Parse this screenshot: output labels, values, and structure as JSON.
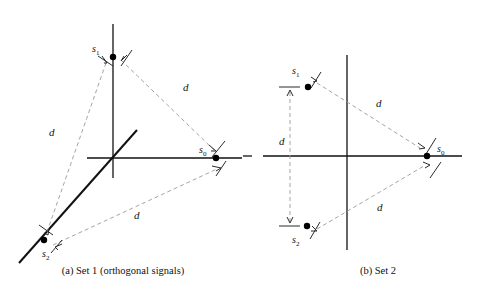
{
  "figure": {
    "panels": [
      {
        "id": "panel-a",
        "caption": "(a) Set 1 (orthogonal signals)",
        "signals": [
          {
            "name": "s",
            "index": "0",
            "x": 216,
            "y": 158
          },
          {
            "name": "s",
            "index": "1",
            "x": 113,
            "y": 57
          },
          {
            "name": "s",
            "index": "2",
            "x": 44,
            "y": 240
          }
        ],
        "distance_labels": [
          {
            "text": "d",
            "x": 53,
            "y": 136
          },
          {
            "text": "d",
            "x": 186,
            "y": 91
          },
          {
            "text": "d",
            "x": 137,
            "y": 218
          }
        ],
        "axes": {
          "origin_x": 113,
          "origin_y": 158,
          "v_top": 24,
          "v_bottom": 178,
          "h_left": 87,
          "h_right": 242,
          "diagonal_x1": 137,
          "diagonal_y1": 130,
          "diagonal_x2": 19,
          "diagonal_y2": 263
        }
      },
      {
        "id": "panel-b",
        "caption": "(b) Set 2",
        "signals": [
          {
            "name": "s",
            "index": "0",
            "x": 427,
            "y": 156
          },
          {
            "name": "s",
            "index": "1",
            "x": 308,
            "y": 87
          },
          {
            "name": "s",
            "index": "2",
            "x": 307,
            "y": 226
          }
        ],
        "distance_labels": [
          {
            "text": "d",
            "x": 283,
            "y": 144
          },
          {
            "text": "d",
            "x": 379,
            "y": 107
          },
          {
            "text": "d",
            "x": 380,
            "y": 211
          }
        ],
        "axes": {
          "origin_x": 347,
          "origin_y": 156,
          "v_top": 55,
          "v_bottom": 250,
          "h_left": 243,
          "h_right": 462,
          "h_gap_start": 252,
          "h_gap_end": 263
        }
      }
    ],
    "colors": {
      "axis": "#111111",
      "dashed": "#9a9a9a",
      "point": "#000000",
      "text": "#111111",
      "background": "#ffffff"
    }
  }
}
